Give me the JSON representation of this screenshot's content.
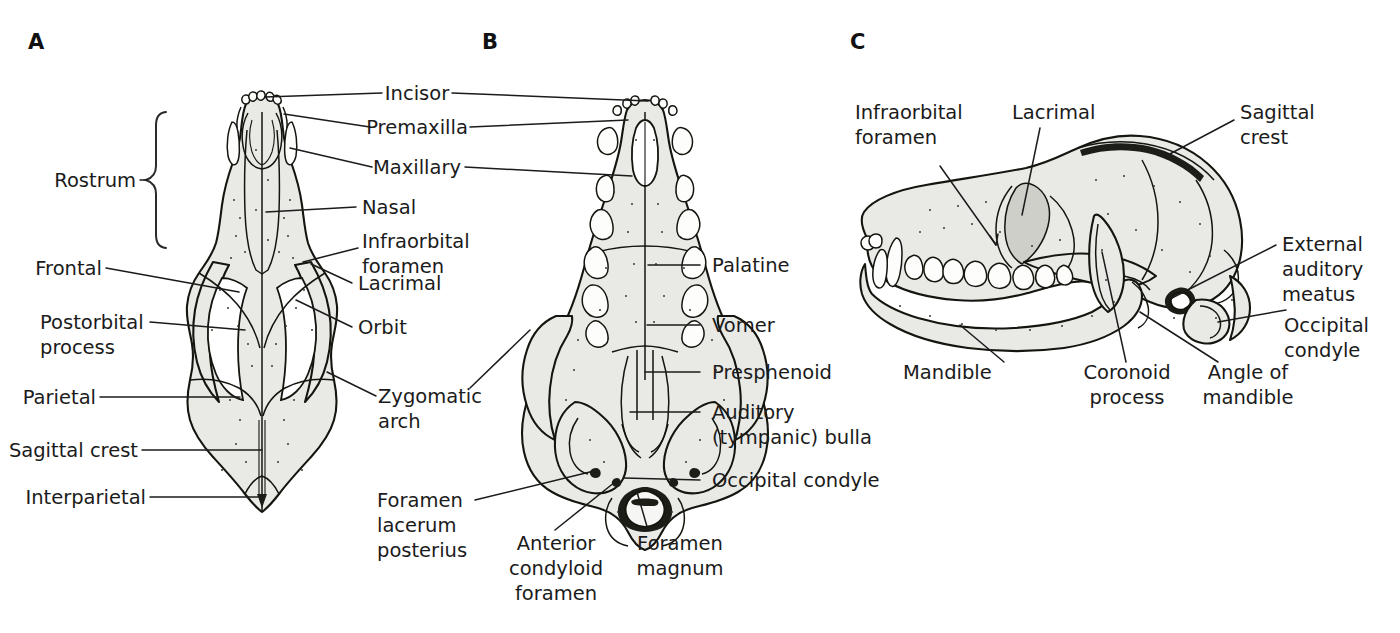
{
  "figure": {
    "background_color": "#ffffff",
    "line_color": "#1b1b1b",
    "bone_fill_color": "#e9e9e6",
    "tooth_fill_color": "#fdfdfc"
  },
  "panels": [
    {
      "letter": "A",
      "view": "dorsal"
    },
    {
      "letter": "B",
      "view": "ventral"
    },
    {
      "letter": "C",
      "view": "lateral"
    }
  ],
  "labels": {
    "rostrum": "Rostrum",
    "incisor": "Incisor",
    "premaxilla": "Premaxilla",
    "maxillary": "Maxillary",
    "nasal": "Nasal",
    "infraorbital_foramen_l1": "Infraorbital",
    "infraorbital_foramen_l2": "foramen",
    "frontal": "Frontal",
    "lacrimal": "Lacrimal",
    "postorbital_l1": "Postorbital",
    "postorbital_l2": "process",
    "orbit": "Orbit",
    "parietal": "Parietal",
    "zygomatic_l1": "Zygomatic",
    "zygomatic_l2": "arch",
    "sagittal_crest": "Sagittal crest",
    "interparietal": "Interparietal",
    "palatine": "Palatine",
    "vomer": "Vomer",
    "presphenoid": "Presphenoid",
    "auditory_bulla_l1": "Auditory",
    "auditory_bulla_l2": "(tympanic) bulla",
    "occipital_condyle_b": "Occipital condyle",
    "foramen_lacerum_l1": "Foramen",
    "foramen_lacerum_l2": "lacerum",
    "foramen_lacerum_l3": "posterius",
    "anterior_condyloid_l1": "Anterior",
    "anterior_condyloid_l2": "condyloid",
    "anterior_condyloid_l3": "foramen",
    "foramen_magnum_l1": "Foramen",
    "foramen_magnum_l2": "magnum",
    "infraorbital_c_l1": "Infraorbital",
    "infraorbital_c_l2": "foramen",
    "lacrimal_c": "Lacrimal",
    "sagittal_crest_c_l1": "Sagittal",
    "sagittal_crest_c_l2": "crest",
    "external_auditory_l1": "External",
    "external_auditory_l2": "auditory",
    "external_auditory_l3": "meatus",
    "occipital_condyle_c_l1": "Occipital",
    "occipital_condyle_c_l2": "condyle",
    "mandible": "Mandible",
    "coronoid_l1": "Coronoid",
    "coronoid_l2": "process",
    "angle_of_mandible_l1": "Angle of",
    "angle_of_mandible_l2": "mandible"
  }
}
